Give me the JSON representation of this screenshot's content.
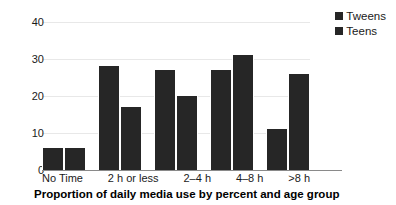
{
  "chart_data": {
    "type": "bar",
    "title": "",
    "categories": [
      "No Time",
      "2 h or less",
      "2–4 h",
      "4–8 h",
      ">8 h"
    ],
    "series": [
      {
        "name": "Tweens",
        "values": [
          6,
          28,
          27,
          27,
          11
        ],
        "color": "#262626"
      },
      {
        "name": "Teens",
        "values": [
          6,
          17,
          20,
          31,
          26
        ],
        "color": "#262626"
      }
    ],
    "xlabel": "Proportion of daily media use by percent and age group",
    "ylabel": "",
    "ylim": [
      0,
      40
    ],
    "yticks": [
      0,
      10,
      20,
      30,
      40
    ],
    "ytick_labels": [
      "0",
      "10",
      "20",
      "30",
      "40"
    ],
    "grid": true,
    "legend_position": "top-right"
  },
  "legend": {
    "items": [
      {
        "label": "Tweens",
        "swatch": "legend-swatch-tweens"
      },
      {
        "label": "Teens",
        "swatch": "legend-swatch-teens"
      }
    ]
  },
  "caption": {
    "text": "Proportion of daily media use by percent and age group"
  },
  "colors": {
    "bar": "#262626",
    "gridline": "#e8e8e8",
    "axis": "#8a8a8a",
    "text": "#1a1a1a",
    "background": "#ffffff"
  }
}
